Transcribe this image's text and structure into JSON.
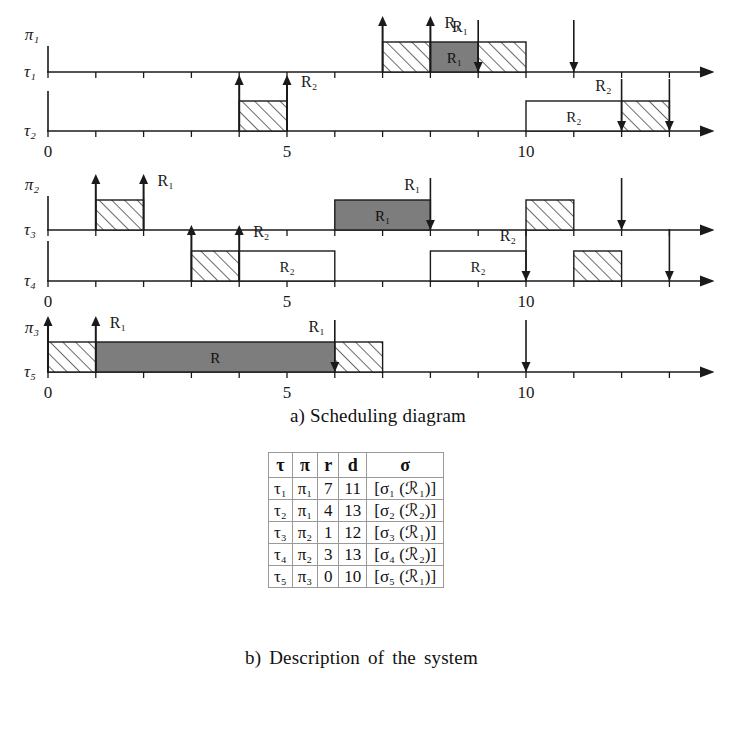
{
  "figure": {
    "caption_a": "a) Scheduling diagram",
    "caption_b": "b) Description of the system"
  },
  "chart_data": {
    "type": "timeline",
    "title": "Scheduling diagram",
    "xlabel": "",
    "time_axis": {
      "min": 0,
      "max": 14.6,
      "ticks": [
        0,
        1,
        2,
        3,
        4,
        5,
        6,
        7,
        8,
        9,
        10,
        11,
        12,
        13,
        14
      ],
      "labeled_ticks": [
        0,
        5,
        10
      ],
      "labels": [
        "0",
        "5",
        "10"
      ]
    },
    "legend": {
      "hatched": "normal execution",
      "dark_gray": "critical section holding R1",
      "white_box": "critical section holding R2"
    },
    "colors": {
      "dark_gray": "#7d7d7d",
      "white": "#ffffff",
      "axis": "#1a1a1a",
      "hatch": "#1a1a1a"
    },
    "processors": [
      {
        "name": "π₁",
        "tasks": [
          {
            "name": "τ₁",
            "releases": [
              {
                "time": 7,
                "label": ""
              },
              {
                "time": 8,
                "label": "R₁"
              }
            ],
            "deadlines": [
              {
                "time": 9,
                "label": "R₁"
              },
              {
                "time": 11,
                "label": ""
              }
            ],
            "blocks": [
              {
                "start": 7,
                "end": 8,
                "fill": "hatched",
                "label": ""
              },
              {
                "start": 8,
                "end": 9,
                "fill": "dark_gray",
                "label": "R₁"
              },
              {
                "start": 9,
                "end": 10,
                "fill": "hatched",
                "label": ""
              }
            ]
          },
          {
            "name": "τ₂",
            "releases": [
              {
                "time": 4,
                "label": ""
              },
              {
                "time": 5,
                "label": "R₂"
              }
            ],
            "deadlines": [
              {
                "time": 12,
                "label": "R₂"
              },
              {
                "time": 13,
                "label": ""
              }
            ],
            "blocks": [
              {
                "start": 4,
                "end": 5,
                "fill": "hatched",
                "label": ""
              },
              {
                "start": 10,
                "end": 12,
                "fill": "white",
                "label": "R₂"
              },
              {
                "start": 12,
                "end": 13,
                "fill": "hatched",
                "label": ""
              }
            ]
          }
        ]
      },
      {
        "name": "π₂",
        "tasks": [
          {
            "name": "τ₃",
            "releases": [
              {
                "time": 1,
                "label": ""
              },
              {
                "time": 2,
                "label": "R₁"
              }
            ],
            "deadlines": [
              {
                "time": 8,
                "label": "R₁"
              },
              {
                "time": 12,
                "label": ""
              }
            ],
            "blocks": [
              {
                "start": 1,
                "end": 2,
                "fill": "hatched",
                "label": ""
              },
              {
                "start": 6,
                "end": 8,
                "fill": "dark_gray",
                "label": "R₁"
              },
              {
                "start": 10,
                "end": 11,
                "fill": "hatched",
                "label": ""
              }
            ]
          },
          {
            "name": "τ₄",
            "releases": [
              {
                "time": 3,
                "label": ""
              },
              {
                "time": 4,
                "label": "R₂"
              }
            ],
            "deadlines": [
              {
                "time": 10,
                "label": "R₂"
              },
              {
                "time": 13,
                "label": ""
              }
            ],
            "blocks": [
              {
                "start": 3,
                "end": 4,
                "fill": "hatched",
                "label": ""
              },
              {
                "start": 4,
                "end": 6,
                "fill": "white",
                "label": "R₂"
              },
              {
                "start": 8,
                "end": 10,
                "fill": "white",
                "label": "R₂"
              },
              {
                "start": 11,
                "end": 12,
                "fill": "hatched",
                "label": ""
              }
            ]
          }
        ]
      },
      {
        "name": "π₃",
        "tasks": [
          {
            "name": "τ₅",
            "releases": [
              {
                "time": 0,
                "label": ""
              },
              {
                "time": 1,
                "label": "R₁"
              }
            ],
            "deadlines": [
              {
                "time": 6,
                "label": "R₁"
              },
              {
                "time": 10,
                "label": ""
              }
            ],
            "blocks": [
              {
                "start": 0,
                "end": 1,
                "fill": "hatched",
                "label": ""
              },
              {
                "start": 1,
                "end": 6,
                "fill": "dark_gray",
                "label": "R"
              },
              {
                "start": 6,
                "end": 7,
                "fill": "hatched",
                "label": ""
              }
            ]
          }
        ]
      }
    ]
  },
  "table": {
    "headers": [
      "τ",
      "π",
      "r",
      "d",
      "σ"
    ],
    "rows": [
      {
        "tau": "τ₁",
        "pi": "π₁",
        "r": "7",
        "d": "11",
        "sigma": "[σ₁ (ℛ₁)]"
      },
      {
        "tau": "τ₂",
        "pi": "π₁",
        "r": "4",
        "d": "13",
        "sigma": "[σ₂ (ℛ₂)]"
      },
      {
        "tau": "τ₃",
        "pi": "π₂",
        "r": "1",
        "d": "12",
        "sigma": "[σ₃ (ℛ₁)]"
      },
      {
        "tau": "τ₄",
        "pi": "π₂",
        "r": "3",
        "d": "13",
        "sigma": "[σ₄ (ℛ₂)]"
      },
      {
        "tau": "τ₅",
        "pi": "π₃",
        "r": "0",
        "d": "10",
        "sigma": "[σ₅ (ℛ₁)]"
      }
    ]
  }
}
